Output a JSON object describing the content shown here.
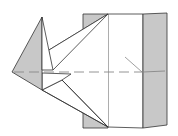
{
  "diagram": {
    "type": "origami-fold-diagram",
    "colors": {
      "paper_back": "#c8c8c8",
      "paper_front": "#ffffff",
      "line": "#333333",
      "crease": "#888888"
    },
    "parts": {
      "left_flap": "gray triangular flap on the left",
      "main_body": "white center panel",
      "right_panel": "gray right panel",
      "center_crease": "dashed horizontal valley fold line"
    }
  }
}
